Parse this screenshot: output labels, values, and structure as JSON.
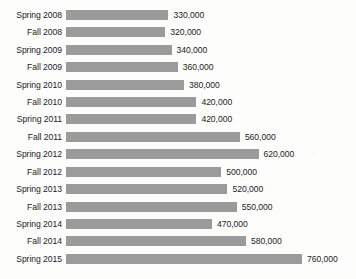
{
  "chart_data": {
    "type": "bar",
    "orientation": "horizontal",
    "title": "",
    "subtitle": "",
    "xlabel": "",
    "ylabel": "",
    "grid": false,
    "legend": false,
    "axis_visible": false,
    "xlim": [
      0,
      760000
    ],
    "value_label_format": "comma-separated integer",
    "bar_color": "#9b9b9b",
    "text_color": "#1c1c1c",
    "background_color": "#fdfdfc",
    "categories": [
      "Spring 2008",
      "Fall 2008",
      "Spring 2009",
      "Fall 2009",
      "Spring 2010",
      "Fall 2010",
      "Spring 2011",
      "Fall 2011",
      "Spring 2012",
      "Fall 2012",
      "Spring 2013",
      "Fall 2013",
      "Spring 2014",
      "Fall 2014",
      "Spring 2015"
    ],
    "values": [
      330000,
      320000,
      340000,
      360000,
      380000,
      420000,
      420000,
      560000,
      620000,
      500000,
      520000,
      550000,
      470000,
      580000,
      760000
    ],
    "value_labels": [
      "330,000",
      "320,000",
      "340,000",
      "360,000",
      "380,000",
      "420,000",
      "420,000",
      "560,000",
      "620,000",
      "500,000",
      "520,000",
      "550,000",
      "470,000",
      "580,000",
      "760,000"
    ]
  }
}
